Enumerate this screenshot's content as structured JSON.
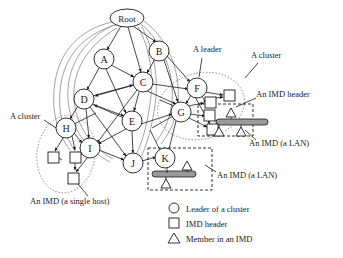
{
  "figure": {
    "type": "network-hierarchy-diagram",
    "background": "#ffffff",
    "stroke": "#1a1a1a",
    "lan_bar_fill": "#9a9a9a"
  },
  "nodes": [
    {
      "id": "Root",
      "label": "Root",
      "shape": "ellipse",
      "cx": 127,
      "cy": 18,
      "rx": 17,
      "ry": 9
    },
    {
      "id": "A",
      "label": "A",
      "shape": "circle",
      "cx": 104,
      "cy": 59,
      "r": 10
    },
    {
      "id": "B",
      "label": "B",
      "shape": "circle",
      "cx": 159,
      "cy": 51,
      "r": 10
    },
    {
      "id": "C",
      "label": "C",
      "shape": "circle",
      "cx": 143,
      "cy": 82,
      "r": 10
    },
    {
      "id": "D",
      "label": "D",
      "shape": "circle",
      "cx": 84,
      "cy": 99,
      "r": 10
    },
    {
      "id": "E",
      "label": "E",
      "shape": "circle",
      "cx": 132,
      "cy": 121,
      "r": 10
    },
    {
      "id": "F",
      "label": "F",
      "shape": "circle",
      "cx": 197,
      "cy": 88,
      "r": 10
    },
    {
      "id": "G",
      "label": "G",
      "shape": "circle",
      "cx": 181,
      "cy": 112,
      "r": 10
    },
    {
      "id": "H",
      "label": "H",
      "shape": "circle",
      "cx": 66,
      "cy": 128,
      "r": 10
    },
    {
      "id": "I",
      "label": "I",
      "shape": "circle",
      "cx": 90,
      "cy": 148,
      "r": 10
    },
    {
      "id": "J",
      "label": "J",
      "shape": "circle",
      "cx": 133,
      "cy": 163,
      "r": 10
    },
    {
      "id": "K",
      "label": "K",
      "shape": "circle",
      "cx": 165,
      "cy": 158,
      "r": 10
    }
  ],
  "headers": [
    {
      "id": "hdr-f1",
      "x": 224,
      "y": 92,
      "size": 11
    },
    {
      "id": "hdr-f2",
      "x": 205,
      "y": 100,
      "size": 11
    },
    {
      "id": "hdr-g1",
      "x": 207,
      "y": 126,
      "size": 11
    },
    {
      "id": "hdr-lan-right",
      "x": 204,
      "y": 113,
      "size": 11
    },
    {
      "id": "hdr-h1",
      "x": 48,
      "y": 155,
      "size": 11
    },
    {
      "id": "hdr-h2",
      "x": 70,
      "y": 155,
      "size": 11
    },
    {
      "id": "hdr-h3",
      "x": 68,
      "y": 176,
      "size": 11
    }
  ],
  "members": [
    {
      "id": "mem-r1",
      "x": 230,
      "y": 110,
      "size": 9
    },
    {
      "id": "mem-r2",
      "x": 215,
      "y": 128,
      "size": 9
    },
    {
      "id": "mem-r3",
      "x": 237,
      "y": 128,
      "size": 9
    },
    {
      "id": "mem-k1",
      "x": 183,
      "y": 163,
      "size": 9
    },
    {
      "id": "mem-k2",
      "x": 162,
      "y": 180,
      "size": 9
    }
  ],
  "lans": [
    {
      "id": "lan-right",
      "x": 216,
      "y": 120,
      "w": 52,
      "h": 6
    },
    {
      "id": "lan-k",
      "x": 152,
      "y": 172,
      "w": 44,
      "h": 6
    }
  ],
  "imd_boxes": [
    {
      "id": "imd-box-right",
      "x": 198,
      "y": 104,
      "w": 55,
      "h": 32
    },
    {
      "id": "imd-box-k",
      "x": 148,
      "y": 148,
      "w": 64,
      "h": 42
    }
  ],
  "clusters": [
    {
      "id": "cluster-right",
      "cx": 201,
      "cy": 106,
      "rx": 44,
      "ry": 33,
      "rot": -14
    },
    {
      "id": "cluster-left",
      "cx": 66,
      "cy": 154,
      "rx": 29,
      "ry": 39,
      "rot": 8
    }
  ],
  "annotations": [
    {
      "id": "a-leader",
      "text": "A leader",
      "x": 193,
      "y": 52
    },
    {
      "id": "a-cluster-right",
      "text": "A cluster",
      "x": 251,
      "y": 57
    },
    {
      "id": "an-imd-header",
      "text": "An IMD header",
      "x": 258,
      "y": 95
    },
    {
      "id": "an-imd-lan-right",
      "text": "An IMD (a LAN)",
      "x": 249,
      "y": 145
    },
    {
      "id": "a-cluster-left",
      "text": "A cluster",
      "x": 12,
      "y": 116
    },
    {
      "id": "an-imd-lan-k",
      "text": "An IMD (a LAN)",
      "x": 218,
      "y": 176
    },
    {
      "id": "an-imd-single-host",
      "text": "An IMD (a single host)",
      "x": 31,
      "y": 203
    }
  ],
  "legend": {
    "x": 168,
    "y": 205,
    "items": [
      {
        "id": "legend-leader",
        "glyph": "circle",
        "text": "Leader of a cluster"
      },
      {
        "id": "legend-header",
        "glyph": "square",
        "text": "IMD header"
      },
      {
        "id": "legend-member",
        "glyph": "triangle",
        "text": "Member in an IMD"
      }
    ]
  }
}
